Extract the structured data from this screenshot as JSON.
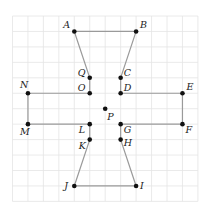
{
  "diagram": {
    "type": "grid-polygon",
    "grid": {
      "cols": 12,
      "rows": 12,
      "x0": 12.5,
      "y0": 16,
      "step": 15.45
    },
    "points": [
      {
        "name": "A",
        "gx": 4,
        "gy": 1,
        "lx": -11,
        "ly": -3
      },
      {
        "name": "B",
        "gx": 8,
        "gy": 1,
        "lx": 4,
        "ly": -3
      },
      {
        "name": "Q",
        "gx": 5,
        "gy": 4,
        "lx": -12,
        "ly": -2
      },
      {
        "name": "C",
        "gx": 7,
        "gy": 4,
        "lx": 3,
        "ly": -2
      },
      {
        "name": "O",
        "gx": 5,
        "gy": 5,
        "lx": -12,
        "ly": -2
      },
      {
        "name": "D",
        "gx": 7,
        "gy": 5,
        "lx": 3,
        "ly": -2
      },
      {
        "name": "N",
        "gx": 1,
        "gy": 5,
        "lx": -8,
        "ly": -5
      },
      {
        "name": "E",
        "gx": 11,
        "gy": 5,
        "lx": 4,
        "ly": -3
      },
      {
        "name": "P",
        "gx": 6,
        "gy": 6,
        "lx": 2,
        "ly": 11
      },
      {
        "name": "M",
        "gx": 1,
        "gy": 7,
        "lx": -8,
        "ly": 11
      },
      {
        "name": "L",
        "gx": 5,
        "gy": 7,
        "lx": -11,
        "ly": 9
      },
      {
        "name": "G",
        "gx": 7,
        "gy": 7,
        "lx": 3,
        "ly": 9
      },
      {
        "name": "F",
        "gx": 11,
        "gy": 7,
        "lx": 3,
        "ly": 9
      },
      {
        "name": "K",
        "gx": 5,
        "gy": 8,
        "lx": -11,
        "ly": 9
      },
      {
        "name": "H",
        "gx": 7,
        "gy": 8,
        "lx": 3,
        "ly": 6
      },
      {
        "name": "J",
        "gx": 4,
        "gy": 11,
        "lx": -10,
        "ly": 3
      },
      {
        "name": "I",
        "gx": 8,
        "gy": 11,
        "lx": 4,
        "ly": 3
      }
    ],
    "polygon": [
      "A",
      "B",
      "C",
      "D",
      "E",
      "F",
      "G",
      "H",
      "I",
      "J",
      "K",
      "L",
      "M",
      "N",
      "O",
      "Q",
      "A"
    ],
    "colors": {
      "grid": "#e4e4e4",
      "edge": "#9a9a9a",
      "point": "#111111",
      "label": "#222222"
    }
  }
}
